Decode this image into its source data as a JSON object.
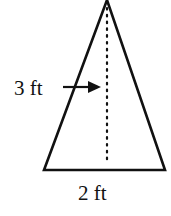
{
  "figure": {
    "shape": "isosceles-triangle",
    "height_label": "3 ft",
    "base_label": "2 ft",
    "stroke_color": "#111111",
    "background_color": "#ffffff"
  }
}
